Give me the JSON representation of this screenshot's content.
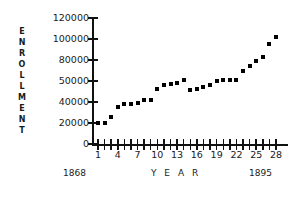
{
  "chart_data": {
    "type": "scatter",
    "title": "",
    "xlabel": "Y E A R",
    "ylabel": "ENROLLMENT",
    "grid": false,
    "legend": "none",
    "x_axis": {
      "tick_labels": [
        "1",
        "4",
        "7",
        "10",
        "13",
        "16",
        "19",
        "22",
        "25",
        "28"
      ],
      "tick_values": [
        1,
        4,
        7,
        10,
        13,
        16,
        19,
        22,
        25,
        28
      ],
      "minor_ticks_every": 1,
      "range": [
        1,
        28
      ],
      "start_year": "1868",
      "end_year": "1895"
    },
    "y_axis": {
      "tick_labels": [
        "120000",
        "100000",
        "80000",
        "50000",
        "40000",
        "20000",
        "0"
      ],
      "tick_values": [
        120000,
        100000,
        80000,
        50000,
        40000,
        20000,
        0
      ],
      "note": "ticks evenly spaced as printed"
    },
    "x": [
      1,
      2,
      3,
      4,
      5,
      6,
      7,
      8,
      9,
      10,
      11,
      12,
      13,
      14,
      15,
      16,
      17,
      18,
      19,
      20,
      21,
      22,
      23,
      24,
      25,
      26,
      27,
      28
    ],
    "years": [
      1868,
      1869,
      1870,
      1871,
      1872,
      1873,
      1874,
      1875,
      1876,
      1877,
      1878,
      1879,
      1880,
      1881,
      1882,
      1883,
      1884,
      1885,
      1886,
      1887,
      1888,
      1889,
      1890,
      1891,
      1892,
      1893,
      1894,
      1895
    ],
    "values": [
      20000,
      20000,
      26000,
      35000,
      38000,
      38000,
      39000,
      41000,
      41000,
      46000,
      48000,
      48500,
      49000,
      52000,
      45500,
      46000,
      47000,
      48000,
      50000,
      51000,
      51000,
      52000,
      65000,
      72000,
      78000,
      83000,
      95000,
      102000
    ],
    "series_name": "Enrollment"
  },
  "labels": {
    "y_title_letters": [
      "E",
      "N",
      "R",
      "O",
      "L",
      "L",
      "M",
      "E",
      "N",
      "T"
    ]
  }
}
